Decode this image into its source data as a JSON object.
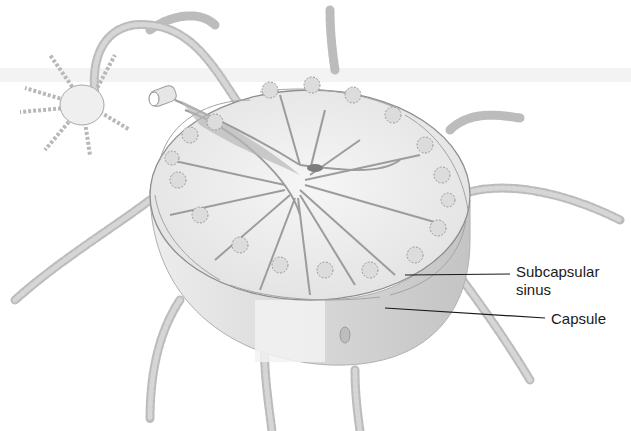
{
  "figure": {
    "labels": [
      {
        "id": "subcapsular-sinus",
        "text_line1": "Subcapsular",
        "text_line2": "sinus"
      },
      {
        "id": "capsule",
        "text_line1": "Capsule"
      }
    ],
    "colors": {
      "background": "#ffffff",
      "ink": "#1a1a1a",
      "tissue_light": "#f0f0f0",
      "tissue_mid": "#c8c8c8",
      "tissue_dark": "#8a8a8a"
    }
  }
}
